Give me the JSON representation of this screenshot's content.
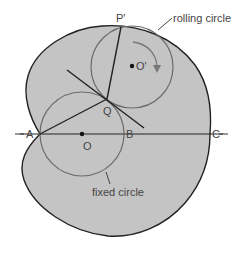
{
  "diagram": {
    "labels": {
      "P_prime": "P'",
      "O_prime": "O'",
      "Q": "Q",
      "A": "A",
      "O": "O",
      "B": "B",
      "C": "C",
      "rolling_circle": "rolling circle",
      "fixed_circle": "fixed circle"
    },
    "colors": {
      "fill": "#c4c4c4",
      "outline": "#222222",
      "circle_stroke": "#6a6a6a",
      "text": "#444444"
    }
  }
}
